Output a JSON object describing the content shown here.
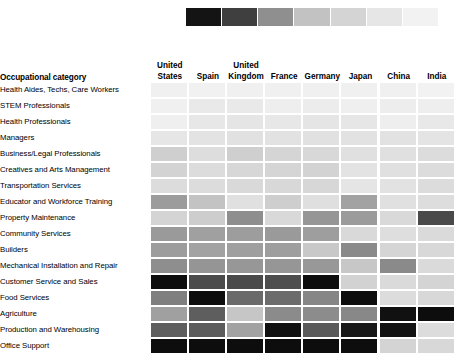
{
  "legend": {
    "name": "sequential-grey-scale-legend",
    "swatches": [
      "#141414",
      "#3f3f3f",
      "#8f8f8f",
      "#c2c2c2",
      "#d4d4d4",
      "#e6e6e6",
      "#f2f2f2"
    ]
  },
  "table": {
    "corner_header": "Occupational category",
    "columns": [
      "United States",
      "Spain",
      "United Kingdom",
      "France",
      "Germany",
      "Japan",
      "China",
      "India"
    ],
    "rows": [
      "Health Aides, Techs, Care Workers",
      "STEM Professionals",
      "Health Professionals",
      "Managers",
      "Business/Legal Professionals",
      "Creatives and Arts Management",
      "Transportation Services",
      "Educator and Workforce Training",
      "Property Maintenance",
      "Community Services",
      "Builders",
      "Mechanical Installation and Repair",
      "Customer Service and Sales",
      "Food Services",
      "Agriculture",
      "Production and Warehousing",
      "Office Support"
    ]
  },
  "chart_data": {
    "type": "heatmap",
    "title": "",
    "xlabel": "",
    "ylabel": "Occupational category",
    "grid": false,
    "legend_position": "top",
    "colormap": "greys-sequential-reversed",
    "x": [
      "United States",
      "Spain",
      "United Kingdom",
      "France",
      "Germany",
      "Japan",
      "China",
      "India"
    ],
    "y": [
      "Health Aides, Techs, Care Workers",
      "STEM Professionals",
      "Health Professionals",
      "Managers",
      "Business/Legal Professionals",
      "Creatives and Arts Management",
      "Transportation Services",
      "Educator and Workforce Training",
      "Property Maintenance",
      "Community Services",
      "Builders",
      "Mechanical Installation and Repair",
      "Customer Service and Sales",
      "Food Services",
      "Agriculture",
      "Production and Warehousing",
      "Office Support"
    ],
    "cell_colors": [
      [
        "#f0f0f0",
        "#f1f1f1",
        "#f0f0f0",
        "#f0f0f0",
        "#f0f0f0",
        "#f0f0f0",
        "#f0f0f0",
        "#f2f2f2"
      ],
      [
        "#f0f0f0",
        "#e9e9e9",
        "#e9e9e9",
        "#eeeeee",
        "#ececec",
        "#efefef",
        "#ededed",
        "#eeeeee"
      ],
      [
        "#efefef",
        "#e7e7e7",
        "#e5e5e5",
        "#e7e7e7",
        "#e5e5e5",
        "#e6e6e6",
        "#eeeeee",
        "#e8e8e8"
      ],
      [
        "#e6e6e6",
        "#e3e3e3",
        "#e1e1e1",
        "#e2e2e2",
        "#e1e1e1",
        "#e2e2e2",
        "#e2e2e2",
        "#e4e4e4"
      ],
      [
        "#cfcfcf",
        "#dddddd",
        "#cfcfcf",
        "#d5d5d5",
        "#d8d8d8",
        "#e0e0e0",
        "#e0e0e0",
        "#dcdcdc"
      ],
      [
        "#d3d3d3",
        "#dcdcdc",
        "#d7d7d7",
        "#d5d5d5",
        "#d3d3d3",
        "#e3e3e3",
        "#e0e0e0",
        "#dcdcdc"
      ],
      [
        "#dcdcdc",
        "#dcdcdc",
        "#d9d9d9",
        "#d8d8d8",
        "#d7d7d7",
        "#e5e5e5",
        "#e2e2e2",
        "#dcdcdc"
      ],
      [
        "#9c9c9c",
        "#c3c3c3",
        "#e0e0e0",
        "#cecece",
        "#dfdfdf",
        "#a2a2a2",
        "#e0e0e0",
        "#dddddd"
      ],
      [
        "#d4d4d4",
        "#cdcdcd",
        "#8e8e8e",
        "#d9d9d9",
        "#969696",
        "#9b9b9b",
        "#d9d9d9",
        "#4a4a4a"
      ],
      [
        "#9a9a9a",
        "#a0a0a0",
        "#9d9d9d",
        "#9a9a9a",
        "#9e9e9e",
        "#d9d9d9",
        "#dedede",
        "#dadada"
      ],
      [
        "#9d9d9d",
        "#a2a2a2",
        "#9f9f9f",
        "#9e9e9e",
        "#c8c8c8",
        "#8a8a8a",
        "#d5d5d5",
        "#d8d8d8"
      ],
      [
        "#8e8e8e",
        "#959595",
        "#979797",
        "#969696",
        "#989898",
        "#c7c7c7",
        "#8a8a8a",
        "#dadada"
      ],
      [
        "#0d0d0d",
        "#4c4c4c",
        "#4a4a4a",
        "#4e4e4e",
        "#0d0d0d",
        "#d2d2d2",
        "#dadada",
        "#d4d4d4"
      ],
      [
        "#7f7f7f",
        "#0d0d0d",
        "#6a6a6a",
        "#6c6c6c",
        "#868686",
        "#0d0d0d",
        "#dcdcdc",
        "#d8d8d8"
      ],
      [
        "#a0a0a0",
        "#5e5e5e",
        "#c6c6c6",
        "#8b8b8b",
        "#8c8c8c",
        "#888888",
        "#111111",
        "#0d0d0d"
      ],
      [
        "#5e5e5e",
        "#5c5c5c",
        "#a2a2a2",
        "#101010",
        "#5a5a5a",
        "#181818",
        "#131313",
        "#dcdcdc"
      ],
      [
        "#0d0d0d",
        "#0d0d0d",
        "#0d0d0d",
        "#0d0d0d",
        "#0d0d0d",
        "#0d0d0d",
        "#d4d4d4",
        "#d8d8d8"
      ]
    ]
  }
}
